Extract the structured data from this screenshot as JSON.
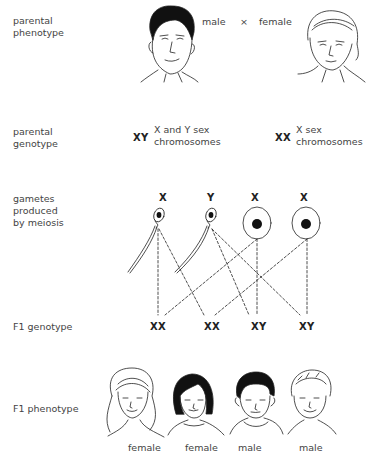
{
  "row_labels": {
    "parental_phenotype": "parental\nphenotype",
    "parental_genotype": "parental\ngenotype",
    "gametes": "gametes\nproduced\nby meiosis",
    "f1_genotype": "F1 genotype",
    "f1_phenotype": "F1 phenotype"
  },
  "parents": {
    "male_label": "male",
    "cross_symbol": "×",
    "female_label": "female",
    "male_genotype": "XY",
    "male_genotype_desc": "X and Y sex\nchromosomes",
    "female_genotype": "XX",
    "female_genotype_desc": "X sex\nchromosomes"
  },
  "gametes": [
    {
      "type": "sperm",
      "chromosome": "X"
    },
    {
      "type": "sperm",
      "chromosome": "Y"
    },
    {
      "type": "egg",
      "chromosome": "X"
    },
    {
      "type": "egg",
      "chromosome": "X"
    }
  ],
  "f1": [
    {
      "genotype": "XX",
      "phenotype": "female"
    },
    {
      "genotype": "XX",
      "phenotype": "female"
    },
    {
      "genotype": "XY",
      "phenotype": "male"
    },
    {
      "genotype": "XY",
      "phenotype": "male"
    }
  ]
}
